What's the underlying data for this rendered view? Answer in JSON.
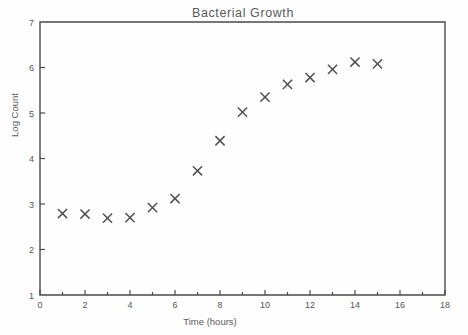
{
  "chart_data": {
    "type": "scatter",
    "title": "Bacterial  Growth",
    "xlabel": "Time  (hours)",
    "ylabel": "Log Count",
    "xlim": [
      0,
      18
    ],
    "ylim": [
      1,
      7
    ],
    "grid": false,
    "legend": null,
    "marker": "x",
    "marker_color": "#4f4f55",
    "x": [
      1,
      2,
      3,
      4,
      5,
      6,
      7,
      8,
      9,
      10,
      11,
      12,
      13,
      14,
      15
    ],
    "y": [
      2.79,
      2.78,
      2.69,
      2.7,
      2.92,
      3.12,
      3.73,
      4.39,
      5.02,
      5.35,
      5.63,
      5.78,
      5.96,
      6.12,
      6.08
    ],
    "xticks": [
      0,
      2,
      4,
      6,
      8,
      10,
      12,
      14,
      16,
      18
    ],
    "xtick_labels": [
      "0",
      "2",
      "4",
      "6",
      "8",
      "10",
      "12",
      "14",
      "16",
      "18"
    ],
    "xticks_minor": [
      1,
      3,
      5,
      7,
      9,
      11,
      13,
      15,
      17
    ],
    "yticks": [
      1,
      2,
      3,
      4,
      5,
      6,
      7
    ],
    "ytick_labels": [
      "1",
      "2",
      "3",
      "4",
      "5",
      "6",
      "7"
    ]
  },
  "colors": {
    "ink": "#4a4a4a",
    "text": "#555555",
    "marker": "#4f4f55",
    "background": "#fefefe"
  }
}
